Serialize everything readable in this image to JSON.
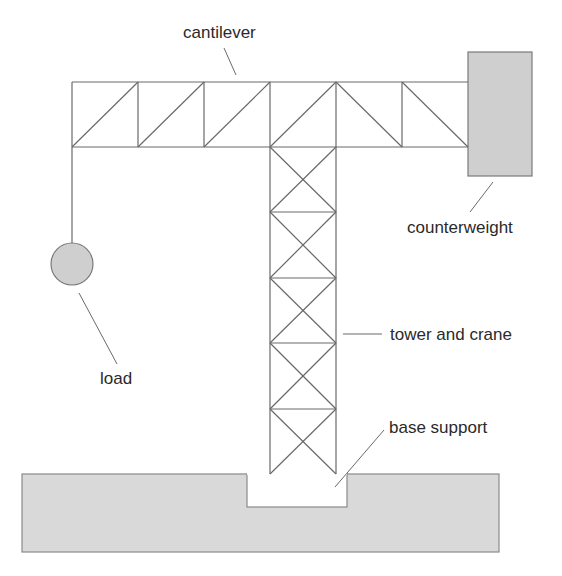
{
  "diagram": {
    "labels": {
      "cantilever": "cantilever",
      "counterweight": "counterweight",
      "load": "load",
      "tower": "tower and crane",
      "base": "base support"
    },
    "colors": {
      "line": "#6a6a6a",
      "fill_gray": "#cfcfcf",
      "ground_fill": "#d9d9d9",
      "text": "#2a2a2a",
      "background": "#ffffff"
    },
    "cantilever": {
      "bays": 6,
      "bay_width": 66,
      "height": 65
    },
    "tower": {
      "panels": 5,
      "width": 66
    }
  }
}
